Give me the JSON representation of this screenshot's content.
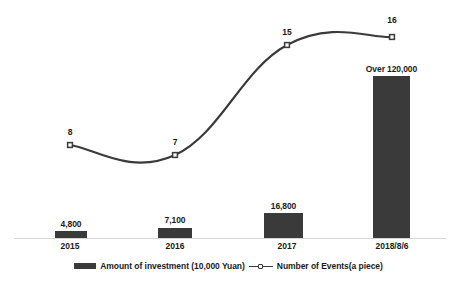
{
  "chart_data": {
    "type": "bar",
    "title": "",
    "subtitle": "",
    "xlabel": "",
    "ylabel": "",
    "grid": false,
    "legend_position": "bottom",
    "categories": [
      "2015",
      "2016",
      "2017",
      "2018/8/6"
    ],
    "series": [
      {
        "name": "Amount of investment (10,000 Yuan)",
        "type": "bar",
        "color": "#3a3a3a",
        "values": [
          4800,
          7100,
          16800,
          120000
        ],
        "value_labels": [
          "4,800",
          "7,100",
          "16,800",
          "Over 120,000"
        ],
        "axis": "left",
        "ylim": [
          0,
          142000
        ]
      },
      {
        "name": "Number of Events(a piece)",
        "type": "line",
        "color": "#3a3a3a",
        "values": [
          8,
          7,
          15,
          16
        ],
        "value_labels": [
          "8",
          "7",
          "15",
          "16"
        ],
        "axis": "right",
        "ylim": [
          0,
          19
        ]
      }
    ]
  },
  "bars": [
    {
      "label": "4,800",
      "x": 55.0,
      "y": 231.0,
      "w": 32.0,
      "h": 6.5,
      "label_x": 71.0,
      "label_y": 219.0
    },
    {
      "label": "7,100",
      "x": 158.0,
      "y": 228.0,
      "w": 34.0,
      "h": 9.5,
      "label_x": 175.0,
      "label_y": 215.0
    },
    {
      "label": "16,800",
      "x": 264.0,
      "y": 213.0,
      "w": 39.0,
      "h": 24.5,
      "label_x": 283.5,
      "label_y": 200.5
    },
    {
      "label": "Over 120,000",
      "x": 373.0,
      "y": 76.0,
      "w": 37.0,
      "h": 161.5,
      "label_x": 391.5,
      "label_y": 63.5
    }
  ],
  "points": [
    {
      "label": "8",
      "x": 70.0,
      "y": 145.0,
      "label_x": 70.0,
      "label_y": 127.0
    },
    {
      "label": "7",
      "x": 175.0,
      "y": 155.0,
      "label_x": 175.0,
      "label_y": 137.0
    },
    {
      "label": "15",
      "x": 287.0,
      "y": 45.0,
      "label_x": 287.0,
      "label_y": 27.0
    },
    {
      "label": "16",
      "x": 392.0,
      "y": 37.0,
      "label_x": 392.0,
      "label_y": 15.0
    }
  ],
  "categories": [
    {
      "label": "2015",
      "x": 70.0
    },
    {
      "label": "2016",
      "x": 175.0
    },
    {
      "label": "2017",
      "x": 287.0
    },
    {
      "label": "2018/8/6",
      "x": 392.0
    }
  ],
  "legend": {
    "bar_series_label": "Amount of investment (10,000 Yuan)",
    "line_series_label": "Number of Events(a piece)"
  },
  "colors": {
    "series": "#3a3a3a",
    "axis": "#d6d6d6",
    "text": "#1a1a1a",
    "background": "#ffffff"
  }
}
